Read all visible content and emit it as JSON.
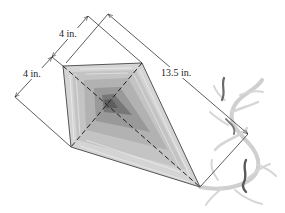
{
  "figure": {
    "dimensions": [
      {
        "id": "dim-top-4",
        "label": "4 in."
      },
      {
        "id": "dim-left-4",
        "label": "4 in."
      },
      {
        "id": "dim-long",
        "label": "13.5 in."
      }
    ],
    "colors": {
      "line": "#333333",
      "kite_outer": "#d4d4d4",
      "kite_mid": "#b5b5b5",
      "kite_inner": "#8a8a8a",
      "kite_center": "#5e5e5e",
      "tail": "#c8c8c8",
      "tail_dark": "#6a6a6a"
    }
  }
}
